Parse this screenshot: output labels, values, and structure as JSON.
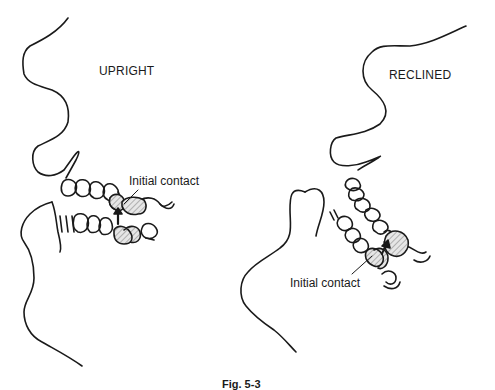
{
  "figure": {
    "caption": "Fig. 5-3",
    "panels": [
      {
        "id": "upright",
        "title": "UPRIGHT",
        "annotation": "Initial contact",
        "arrow": "upward arrow from lower tooth to upper tooth"
      },
      {
        "id": "reclined",
        "title": "RECLINED",
        "annotation": "Initial contact",
        "arrow": "arrow between upper and lower teeth"
      }
    ]
  },
  "colors": {
    "line": "#1a1a1a",
    "hatch": "#8a8a8a",
    "background": "#ffffff"
  }
}
